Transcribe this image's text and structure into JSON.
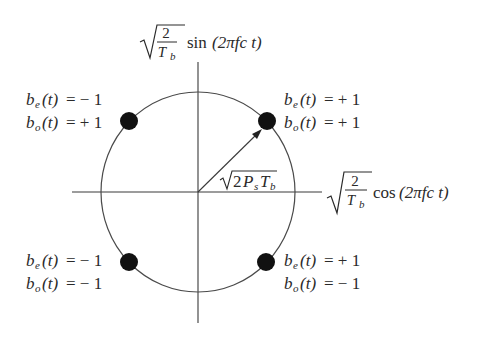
{
  "diagram": {
    "y_axis_label": {
      "coef_numer": "2",
      "coef_denom": "T",
      "coef_denom_sub": "b",
      "func": "sin",
      "arg": "(2πfc t)"
    },
    "x_axis_label": {
      "coef_numer": "2",
      "coef_denom": "T",
      "coef_denom_sub": "b",
      "func": "cos",
      "arg": "(2πfc t)"
    },
    "radius_label": {
      "text": "2P",
      "sub1": "s",
      "text2": "T",
      "sub2": "b"
    },
    "points": [
      {
        "id": "upper-left",
        "be": "= − 1",
        "bo": "= + 1"
      },
      {
        "id": "upper-right",
        "be": "= + 1",
        "bo": "= + 1"
      },
      {
        "id": "lower-left",
        "be": "= − 1",
        "bo": "= − 1"
      },
      {
        "id": "lower-right",
        "be": "= + 1",
        "bo": "= − 1"
      }
    ],
    "symbols": {
      "be_letter": "b",
      "be_sub": "e",
      "bo_letter": "b",
      "bo_sub": "o",
      "arg_t": "(t)"
    },
    "colors": {
      "ink": "#2a2a2a",
      "dot": "#111111",
      "background": "#ffffff"
    }
  }
}
